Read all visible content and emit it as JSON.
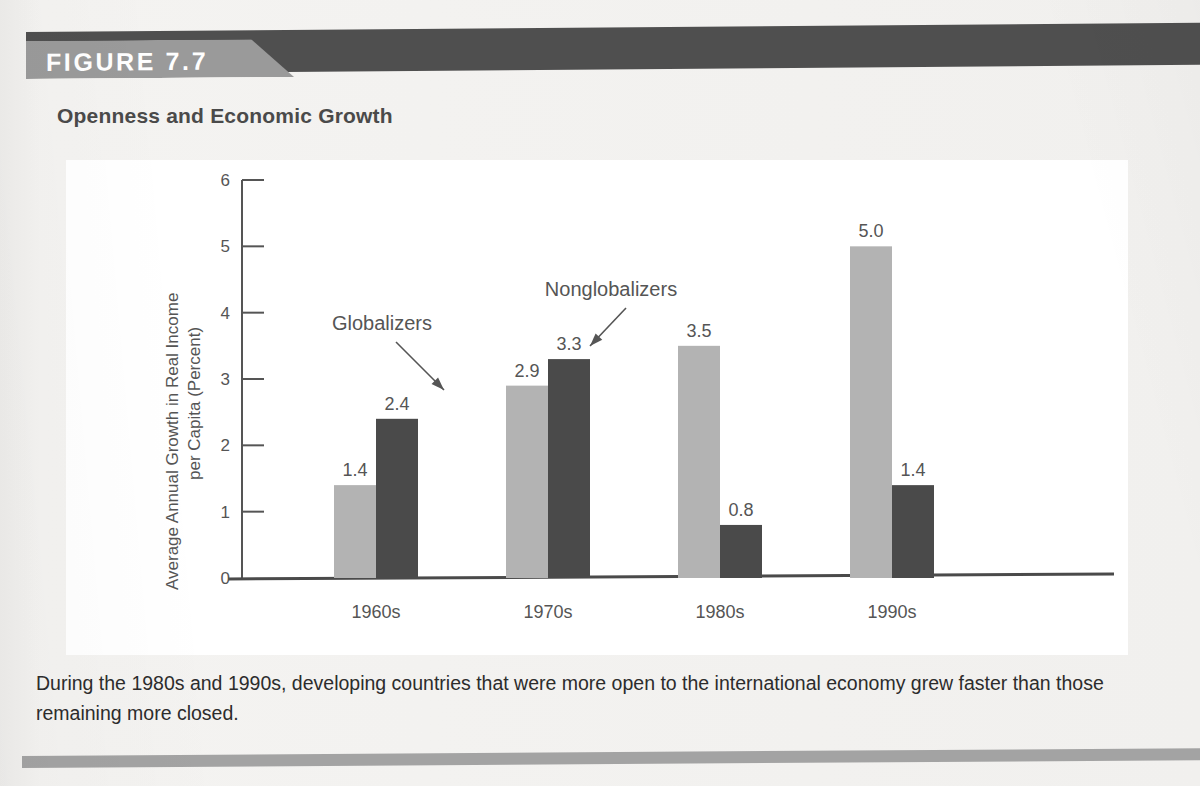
{
  "figure": {
    "badge_label": "FIGURE 7.7",
    "title": "Openness and Economic Growth",
    "caption": "During the 1980s and 1990s, developing countries that were more open to the international economy grew faster than those remaining more closed."
  },
  "colors": {
    "page_background": "#f1f0ee",
    "panel_background": "#ffffff",
    "banner_dark": "#4f4f4f",
    "banner_tab": "#9a9a9a",
    "badge_text": "#ffffff",
    "title_text": "#4a4a4a",
    "caption_text": "#2c2c2c",
    "axis": "#555555",
    "globalizers_bar": "#b3b3b3",
    "nonglobalizers_bar": "#4a4a4a",
    "bottom_rule": "#a3a3a3"
  },
  "chart_data": {
    "type": "bar",
    "title": "Openness and Economic Growth",
    "xlabel": "",
    "ylabel": "Average Annual Growth in Real Income per Capita (Percent)",
    "ylabel_lines": [
      "Average Annual Growth in Real Income",
      "per Capita (Percent)"
    ],
    "categories": [
      "1960s",
      "1970s",
      "1980s",
      "1990s"
    ],
    "series": [
      {
        "name": "Globalizers",
        "values": [
          1.4,
          2.9,
          3.5,
          5.0
        ],
        "color": "#b3b3b3"
      },
      {
        "name": "Nonglobalizers",
        "values": [
          2.4,
          3.3,
          0.8,
          1.4
        ],
        "color": "#4a4a4a"
      }
    ],
    "value_labels": {
      "Globalizers": [
        "1.4",
        "2.9",
        "3.5",
        "5.0"
      ],
      "Nonglobalizers": [
        "2.4",
        "3.3",
        "0.8",
        "1.4"
      ]
    },
    "ylim": [
      0,
      6
    ],
    "yticks": [
      0,
      1,
      2,
      3,
      4,
      5,
      6
    ],
    "ytick_labels": [
      "0",
      "1",
      "2",
      "3",
      "4",
      "5",
      "6"
    ],
    "grid": false,
    "legend_position": "annotations",
    "annotations": [
      {
        "text": "Globalizers",
        "points_to": "1970s Globalizers bar top"
      },
      {
        "text": "Nonglobalizers",
        "points_to": "1970s Nonglobalizers bar top"
      }
    ]
  }
}
